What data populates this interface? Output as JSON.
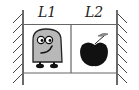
{
  "labels": {
    "left_region": "L1",
    "right_region": "L2"
  },
  "figure": {
    "left_object": "cartoon-character",
    "right_object": "apple"
  },
  "colors": {
    "line": "#555555",
    "character_fill": "#b8b8b8",
    "apple_fill": "#111111",
    "leaf_fill": "#999999"
  }
}
